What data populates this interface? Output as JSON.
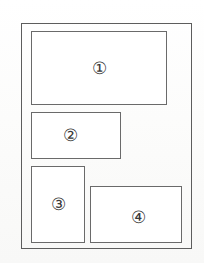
{
  "diagram": {
    "background_color": "#fdfdfc",
    "line_color": "#5d5d5d",
    "label_color": "#3a3a3a",
    "frame": {
      "name": "outer-frame",
      "x": 21,
      "y": 23,
      "width": 171,
      "height": 226
    },
    "regions": [
      {
        "id": "region-1",
        "label": "①",
        "number": 1,
        "x": 31,
        "y": 31,
        "width": 136,
        "height": 74
      },
      {
        "id": "region-2",
        "label": "②",
        "number": 2,
        "x": 31,
        "y": 112,
        "width": 90,
        "height": 47
      },
      {
        "id": "region-3",
        "label": "③",
        "number": 3,
        "x": 31,
        "y": 166,
        "width": 54,
        "height": 77
      },
      {
        "id": "region-4",
        "label": "④",
        "number": 4,
        "x": 90,
        "y": 186,
        "width": 92,
        "height": 57
      }
    ]
  }
}
